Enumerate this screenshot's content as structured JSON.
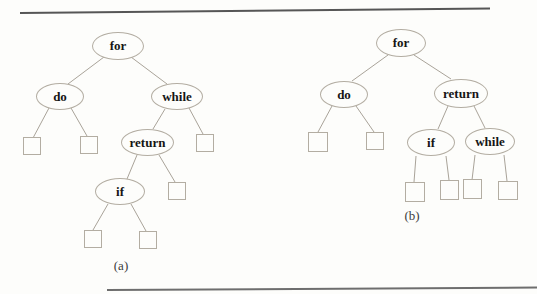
{
  "figure": {
    "caption_a": "(a)",
    "caption_b": "(b)",
    "colors": {
      "node_outline": "#b3ada2",
      "edge": "#a9a399",
      "node_text": "#151515",
      "top_rule": "#565656",
      "bottom_rule": "#6e6e6e",
      "background": "#fdfdfb"
    },
    "tree_a": {
      "nodes": {
        "for": "for",
        "do": "do",
        "while": "while",
        "return": "return",
        "if": "if"
      },
      "leaf_count": 6,
      "structure": [
        "for -> do, while",
        "do -> leaf, leaf",
        "while -> return, leaf",
        "return -> if, leaf",
        "if -> leaf, leaf"
      ]
    },
    "tree_b": {
      "nodes": {
        "for": "for",
        "do": "do",
        "return": "return",
        "if": "if",
        "while": "while"
      },
      "leaf_count": 6,
      "structure": [
        "for -> do, return",
        "do -> leaf, leaf",
        "return -> if, while",
        "if -> leaf, leaf",
        "while -> leaf, leaf"
      ]
    }
  }
}
